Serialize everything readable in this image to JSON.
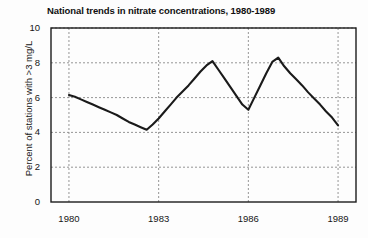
{
  "chart_data": {
    "type": "line",
    "title": "National trends in nitrate concentrations, 1980-1989",
    "xlabel": "",
    "ylabel": "Percent of stations with >3 mg/L",
    "xlim": [
      1979.4,
      1989.6
    ],
    "ylim": [
      0,
      10
    ],
    "xticks": [
      1980,
      1983,
      1986,
      1989
    ],
    "yticks": [
      0,
      2,
      4,
      6,
      8,
      10
    ],
    "grid": "dashed both axes",
    "legend": "none",
    "line_color": "#1a1a1a",
    "series": [
      {
        "name": "Percent of stations with >3 mg/L",
        "x": [
          1980.0,
          1980.2,
          1980.4,
          1980.6,
          1980.8,
          1981.0,
          1981.2,
          1981.4,
          1981.6,
          1981.8,
          1982.0,
          1982.2,
          1982.4,
          1982.6,
          1982.8,
          1983.0,
          1983.2,
          1983.4,
          1983.6,
          1983.8,
          1984.0,
          1984.2,
          1984.4,
          1984.6,
          1984.8,
          1985.0,
          1985.2,
          1985.4,
          1985.6,
          1985.8,
          1986.0,
          1986.2,
          1986.4,
          1986.6,
          1986.8,
          1987.0,
          1987.2,
          1987.4,
          1987.6,
          1987.8,
          1988.0,
          1988.2,
          1988.4,
          1988.6,
          1988.8,
          1989.0
        ],
        "y": [
          6.15,
          6.05,
          5.9,
          5.75,
          5.6,
          5.45,
          5.3,
          5.15,
          5.0,
          4.8,
          4.6,
          4.45,
          4.3,
          4.15,
          4.45,
          4.8,
          5.2,
          5.6,
          6.0,
          6.35,
          6.7,
          7.1,
          7.5,
          7.85,
          8.1,
          7.6,
          7.1,
          6.6,
          6.1,
          5.6,
          5.3,
          6.0,
          6.7,
          7.4,
          8.05,
          8.3,
          7.8,
          7.4,
          7.05,
          6.7,
          6.3,
          5.95,
          5.6,
          5.2,
          4.85,
          4.4
        ]
      }
    ]
  }
}
